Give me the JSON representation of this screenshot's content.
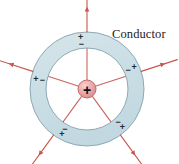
{
  "figure": {
    "title_label": "Conductor",
    "center_charge_sign": "+",
    "background_color": "#ffffff",
    "shell_fill_color": "#ccdee4",
    "shell_stroke_color": "#8fa9b4",
    "field_line_color": "#c9564e",
    "charge_color": "#e8a0a0",
    "charge_edge_color": "#c06a6a",
    "label_color": "#1b1b1b",
    "sign_color": "#2a2a2a"
  },
  "geometry": {
    "center_x": 87,
    "center_y": 89,
    "outer_radius": 57,
    "inner_radius": 41,
    "charge_radius": 9
  },
  "label": {
    "text": "Conductor",
    "x": 112,
    "y": 38
  },
  "field_lines": [
    {
      "name": "field-line-up",
      "angle_deg": 90,
      "outer_length": 95,
      "arrow_at": 78,
      "inner_sign": "−",
      "outer_sign": "+"
    },
    {
      "name": "field-line-upper-right",
      "angle_deg": 18,
      "outer_length": 95,
      "arrow_at": 78,
      "inner_sign": "−",
      "outer_sign": "+"
    },
    {
      "name": "field-line-lower-right",
      "angle_deg": 306,
      "outer_length": 95,
      "arrow_at": 78,
      "inner_sign": "−",
      "outer_sign": "+"
    },
    {
      "name": "field-line-lower-left",
      "angle_deg": 234,
      "outer_length": 95,
      "arrow_at": 78,
      "inner_sign": "−",
      "outer_sign": "+"
    },
    {
      "name": "field-line-upper-left",
      "angle_deg": 162,
      "outer_length": 95,
      "arrow_at": 78,
      "inner_sign": "−",
      "outer_sign": "+"
    }
  ],
  "inner_signs": {
    "glyph": "−",
    "count": 5,
    "font_size": 9
  },
  "outer_signs": {
    "glyph": "+",
    "count": 5,
    "font_size": 9
  }
}
